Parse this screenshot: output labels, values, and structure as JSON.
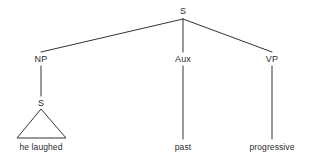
{
  "figure": {
    "type": "constituency-syntax-tree",
    "width": 313,
    "height": 164,
    "background_color": "#ffffff",
    "line_color": "#333333",
    "text_color": "#2b2b2b",
    "line_width": 1
  },
  "nodes": {
    "root": {
      "label": "S",
      "x": 183,
      "y": 11
    },
    "np": {
      "label": "NP",
      "x": 41,
      "y": 59
    },
    "aux": {
      "label": "Aux",
      "x": 183,
      "y": 59
    },
    "vp": {
      "label": "VP",
      "x": 272,
      "y": 59
    },
    "embedded_s": {
      "label": "S",
      "x": 41,
      "y": 103
    }
  },
  "terminals": {
    "np_terminal": {
      "label": "he laughed",
      "x": 41,
      "y": 147
    },
    "aux_terminal": {
      "label": "past",
      "x": 183,
      "y": 147
    },
    "vp_terminal": {
      "label": "progressive",
      "x": 272,
      "y": 147
    }
  },
  "triangle": {
    "apex_x": 41,
    "apex_y": 109,
    "left_x": 17,
    "right_x": 66,
    "base_y": 138
  },
  "edges": [
    {
      "name": "root-to-np",
      "x1": 183,
      "y1": 19,
      "x2": 41,
      "y2": 52
    },
    {
      "name": "root-to-aux",
      "x1": 183,
      "y1": 19,
      "x2": 183,
      "y2": 52
    },
    {
      "name": "root-to-vp",
      "x1": 183,
      "y1": 19,
      "x2": 272,
      "y2": 52
    },
    {
      "name": "np-to-embedded-s",
      "x1": 41,
      "y1": 66,
      "x2": 41,
      "y2": 96
    },
    {
      "name": "aux-to-past",
      "x1": 183,
      "y1": 66,
      "x2": 183,
      "y2": 139
    },
    {
      "name": "vp-to-progressive",
      "x1": 272,
      "y1": 66,
      "x2": 272,
      "y2": 139
    }
  ]
}
